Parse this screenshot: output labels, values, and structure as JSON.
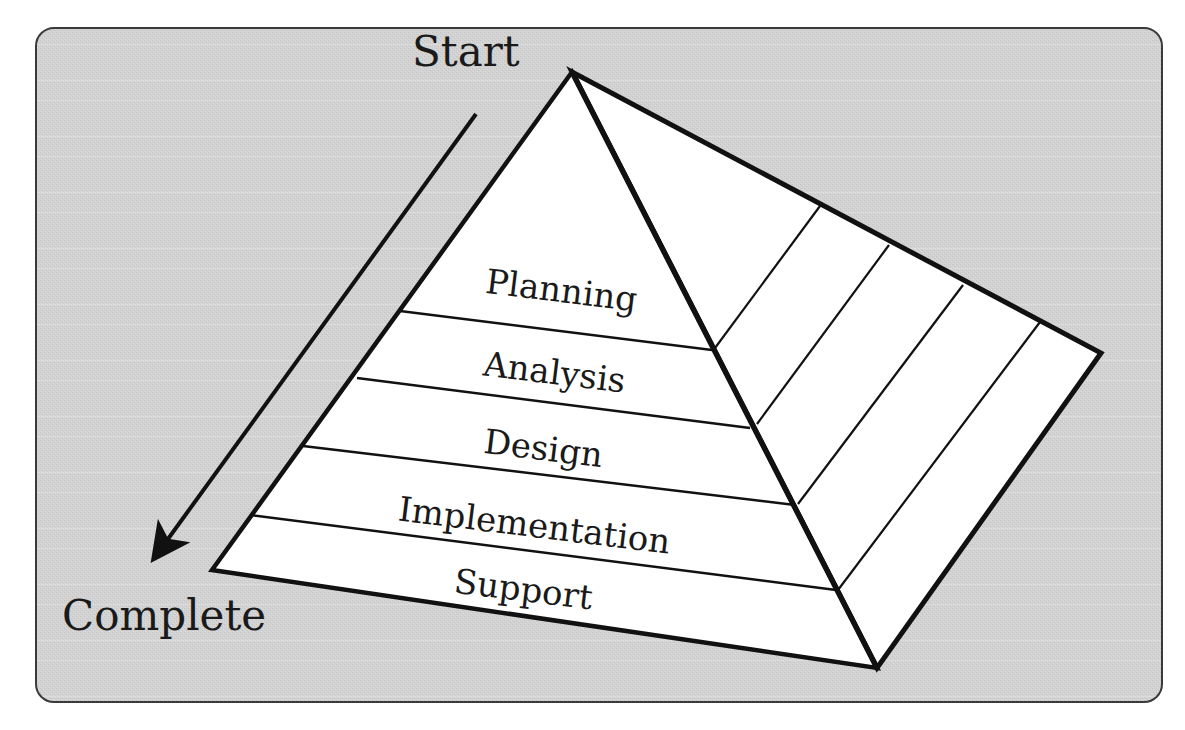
{
  "diagram": {
    "type": "pyramid",
    "panel": {
      "background": "#d4d4d4",
      "border": "#3a3a3a"
    },
    "start_label": "Start",
    "end_label": "Complete",
    "flow_direction": "Start to Complete (top to bottom)",
    "layers": [
      {
        "label": "Planning"
      },
      {
        "label": "Analysis"
      },
      {
        "label": "Design"
      },
      {
        "label": "Implementation"
      },
      {
        "label": "Support"
      }
    ],
    "colors": {
      "face_fill": "#ffffff",
      "edge_stroke": "#111111",
      "text": "#1a1a1a"
    }
  }
}
